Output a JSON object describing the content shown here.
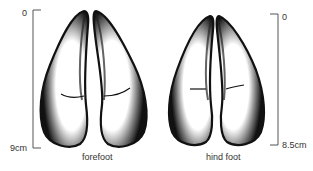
{
  "diagram": {
    "forefoot": {
      "label": "forefoot",
      "scale_top": "0",
      "scale_bottom": "9cm"
    },
    "hindfoot": {
      "label": "hind foot",
      "scale_top": "0",
      "scale_bottom": "8.5cm"
    },
    "colors": {
      "ink": "#111111",
      "scale": "#555555",
      "background": "#ffffff"
    }
  }
}
